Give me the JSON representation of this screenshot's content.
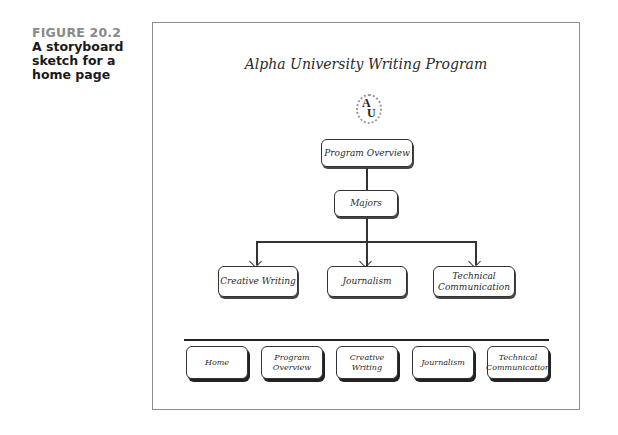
{
  "caption": {
    "figure_label": "FIGURE 20.2",
    "title": "A storyboard sketch for a home page"
  },
  "sketch": {
    "site_title": "Alpha University Writing Program",
    "logo": {
      "letters_top": "A",
      "letters_bottom": "U",
      "icon": "university-seal-icon"
    },
    "hierarchy": {
      "level1": "Program Overview",
      "level2": "Majors",
      "level3": [
        "Creative Writing",
        "Journalism",
        "Technical Communication"
      ]
    },
    "nav_buttons": [
      "Home",
      "Program Overview",
      "Creative Writing",
      "Journalism",
      "Technical Communication"
    ]
  }
}
